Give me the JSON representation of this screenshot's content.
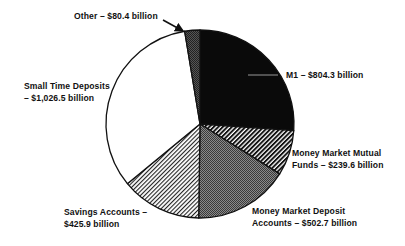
{
  "chart_data": {
    "type": "pie",
    "title": "",
    "unit": "billion",
    "start_angle_deg": 0,
    "direction": "clockwise",
    "slices": [
      {
        "name": "M1",
        "value": 804.3,
        "pattern": "solid-black",
        "label_line1": "M1 – $804.3 billion",
        "label_line2": ""
      },
      {
        "name": "Money Market Mutual Funds",
        "value": 239.6,
        "pattern": "diagonal-hatch-dense",
        "label_line1": "Money Market Mutual",
        "label_line2": "Funds – $239.6 billion"
      },
      {
        "name": "Money Market Deposit Accounts",
        "value": 502.7,
        "pattern": "dark-stipple",
        "label_line1": "Money Market Deposit",
        "label_line2": "Accounts  –  $502.7  billion"
      },
      {
        "name": "Savings Accounts",
        "value": 425.9,
        "pattern": "diagonal-hatch-light",
        "label_line1": "Savings Accounts –",
        "label_line2": "$425.9  billion"
      },
      {
        "name": "Small Time Deposits",
        "value": 1026.5,
        "pattern": "white",
        "label_line1": "Small Time Deposits",
        "label_line2": "– $1,026.5 billion"
      },
      {
        "name": "Other",
        "value": 80.4,
        "pattern": "gray-stipple",
        "label_line1": "Other – $80.4 billion",
        "label_line2": ""
      }
    ],
    "legend": "none",
    "grid": false
  },
  "labels": {
    "m1": "M1 – $804.3 billion",
    "mmmf_1": "Money Market Mutual",
    "mmmf_2": "Funds – $239.6 billion",
    "mmda_1": "Money Market Deposit",
    "mmda_2": "Accounts  –  $502.7  billion",
    "savings_1": "Savings Accounts –",
    "savings_2": "$425.9  billion",
    "small_time_1": "Small Time Deposits",
    "small_time_2": "– $1,026.5 billion",
    "other": "Other – $80.4 billion"
  }
}
